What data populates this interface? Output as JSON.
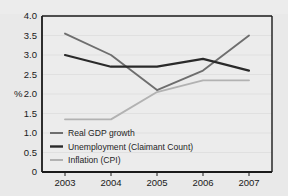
{
  "chart_data": {
    "type": "line",
    "title": "",
    "xlabel": "",
    "ylabel": "%",
    "categories": [
      "2003",
      "2004",
      "2005",
      "2006",
      "2007"
    ],
    "x": [
      2003,
      2004,
      2005,
      2006,
      2007
    ],
    "ylim": [
      0,
      4.0
    ],
    "ytick_labels": [
      "4.0",
      "3.5",
      "3.0",
      "2.5",
      "2.0",
      "1.5",
      "1.0",
      "0.5",
      "0"
    ],
    "ytick_values": [
      4.0,
      3.5,
      3.0,
      2.5,
      2.0,
      1.5,
      1.0,
      0.5,
      0
    ],
    "grid": true,
    "grid_axis": "y",
    "legend_position": "bottom-left-inside",
    "series": [
      {
        "name": "Real GDP growth",
        "color": "#6e6e6e",
        "values": [
          3.55,
          3.0,
          2.1,
          2.6,
          3.5
        ]
      },
      {
        "name": "Unemployment (Claimant Count)",
        "color": "#2a2a2a",
        "values": [
          3.0,
          2.7,
          2.7,
          2.9,
          2.6
        ]
      },
      {
        "name": "Inflation (CPI)",
        "color": "#b2b2b2",
        "values": [
          1.35,
          1.35,
          2.05,
          2.35,
          2.35
        ]
      }
    ]
  },
  "axis": {
    "y_unit_label": "%"
  },
  "colors": {
    "background": "#e9e9e9",
    "plot_background": "#ececec",
    "frame": "#1a1a1a",
    "gridline": "#e0e0e0",
    "series_gdp": "#6e6e6e",
    "series_unemployment": "#2a2a2a",
    "series_inflation": "#b2b2b2"
  }
}
